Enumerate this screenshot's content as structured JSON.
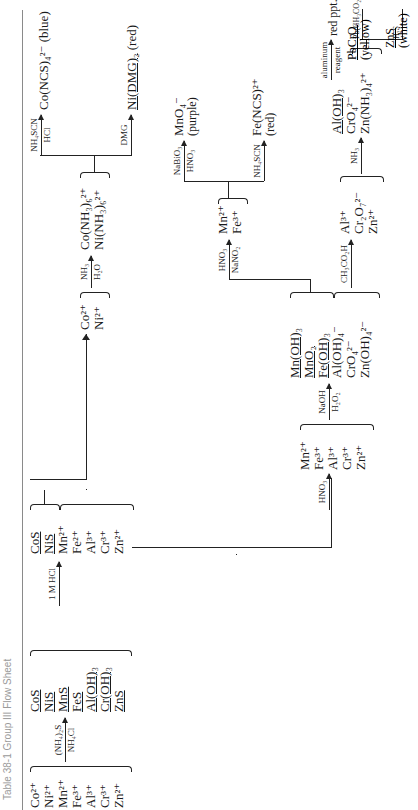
{
  "title": "Table 38-1   Group III Flow Sheet",
  "initial_ions": [
    "Co²⁺",
    "Ni²⁺",
    "Mn²⁺",
    "Fe³⁺",
    "Al³⁺",
    "Cr³⁺",
    "Zn²⁺"
  ],
  "step1": {
    "reagent_top": "(NH₄)₂S",
    "reagent_bottom": "NH₄Cl"
  },
  "precipitates": [
    "CoS",
    "NiS",
    "MnS",
    "FeS",
    "Al(OH)₃",
    "Cr(OH)₃",
    "ZnS"
  ],
  "step2": {
    "reagent_top": "1 M HCl",
    "reagent_bottom": ""
  },
  "after_hcl": {
    "solids": [
      "CoS",
      "NiS"
    ],
    "solution": [
      "Mn²⁺",
      "Fe²⁺",
      "Al³⁺",
      "Cr³⁺",
      "Zn²⁺"
    ]
  },
  "co_ni_branch": {
    "ions": [
      "Co²⁺",
      "Ni²⁺"
    ],
    "reagent_top": "NH₃",
    "reagent_bottom": "H₂O",
    "complexes": [
      "Co(NH₃)₆²⁺",
      "Ni(NH₃)₆²⁺"
    ],
    "co_test": {
      "reagent_top": "NH₄SCN",
      "reagent_bottom": "HCl",
      "product": "Co(NCS)₄²⁻",
      "color": "(blue)"
    },
    "ni_test": {
      "reagent_top": "DMG",
      "reagent_bottom": "",
      "product": "Ni(DMG)₂",
      "color": "(red)"
    }
  },
  "main_branch": {
    "reagent_top": "HNO₃",
    "ions": [
      "Mn²⁺",
      "Fe³⁺",
      "Al³⁺",
      "Cr³⁺",
      "Zn²⁺"
    ],
    "naoh_step": {
      "reagent_top": "NaOH",
      "reagent_bottom": "H₂O₂"
    },
    "solids": [
      "Mn(OH)₃",
      "MnO₂",
      "Fe(OH)₃"
    ],
    "solution": [
      "Al(OH)₄⁻",
      "CrO₄²⁻",
      "Zn(OH)₄²⁻"
    ]
  },
  "mn_fe_branch": {
    "reagent_top": "HNO₃",
    "reagent_bottom": "NaNO₂",
    "ions": [
      "Mn²⁺",
      "Fe³⁺"
    ],
    "mn_test": {
      "reagent_top": "NaBiO₃",
      "reagent_bottom": "HNO₃",
      "product": "MnO₄⁻",
      "color": "(purple)"
    },
    "fe_test": {
      "reagent_top": "NH₄SCN",
      "reagent_bottom": "",
      "product": "Fe(NCS)²⁺",
      "color": "(red)"
    }
  },
  "al_cr_zn_branch": {
    "acid_step": {
      "reagent_top": "CH₃CO₂H",
      "reagent_bottom": ""
    },
    "ions": [
      "Al³⁺",
      "Cr₂O₇²⁻",
      "Zn²⁺"
    ],
    "nh3_step": {
      "reagent_top": "NH₃",
      "reagent_bottom": ""
    },
    "al_solid": "Al(OH)₃",
    "al_test": {
      "reagent_top": "aluminum",
      "reagent_bottom": "reagent",
      "product": "red ppt."
    },
    "solution": [
      "CrO₄²⁻",
      "Zn(NH₃)₄²⁺"
    ],
    "cr_test": {
      "reagent_top": "Pb(CH₃CO₂)₂",
      "product": "PbCrO₄",
      "color": "(yellow)"
    },
    "zn_test": {
      "reagent_top": "H₂S",
      "product": "ZnS",
      "color": "(white)"
    }
  }
}
